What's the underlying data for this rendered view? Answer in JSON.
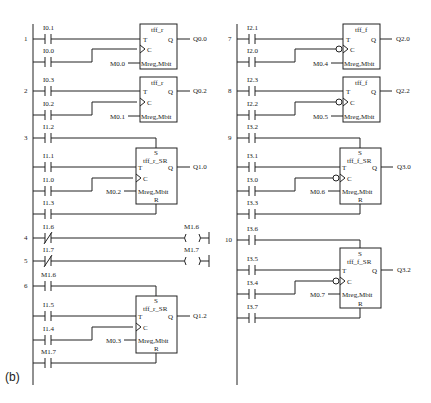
{
  "caption": "(b)",
  "left_column": {
    "networks": [
      {
        "number": "1",
        "type": "tff_r",
        "block_title": "tff_r",
        "T_input": "I0.1",
        "C_input": "I0.0",
        "mem": "M0.0",
        "mem_pin": "Mreg,Mbit",
        "output": "Q0.0",
        "T_pin": "T",
        "C_pin": "C",
        "Q_pin": "Q"
      },
      {
        "number": "2",
        "type": "tff_r",
        "block_title": "tff_r",
        "T_input": "I0.3",
        "C_input": "I0.2",
        "mem": "M0.1",
        "mem_pin": "Mreg,Mbit",
        "output": "Q0.2",
        "T_pin": "T",
        "C_pin": "C",
        "Q_pin": "Q"
      },
      {
        "number": "3",
        "type": "tff_r_SR",
        "block_title": "tff_r_SR",
        "S_input": "I1.2",
        "T_input": "I1.1",
        "C_input": "I1.0",
        "R_input": "I1.3",
        "mem": "M0.2",
        "mem_pin": "Mreg,Mbit",
        "output": "Q1.0",
        "S_pin": "S",
        "R_pin": "R",
        "T_pin": "T",
        "C_pin": "C",
        "Q_pin": "Q"
      },
      {
        "number": "4",
        "type": "coil",
        "contact": "I1.6",
        "contact_type": "normally-closed",
        "coil": "M1.6"
      },
      {
        "number": "5",
        "type": "coil",
        "contact": "I1.7",
        "contact_type": "normally-closed",
        "coil": "M1.7"
      },
      {
        "number": "6",
        "type": "tff_r_SR",
        "block_title": "tff_r_SR",
        "S_input": "M1.6",
        "T_input": "I1.5",
        "C_input": "I1.4",
        "R_input": "M1.7",
        "mem": "M0.3",
        "mem_pin": "Mreg,Mbit",
        "output": "Q1.2",
        "S_pin": "S",
        "R_pin": "R",
        "T_pin": "T",
        "C_pin": "C",
        "Q_pin": "Q"
      }
    ]
  },
  "right_column": {
    "networks": [
      {
        "number": "7",
        "type": "tff_f",
        "block_title": "tff_f",
        "T_input": "I2.1",
        "C_input": "I2.0",
        "mem": "M0.4",
        "mem_pin": "Mreg,Mbit",
        "output": "Q2.0",
        "T_pin": "T",
        "C_pin": "C",
        "Q_pin": "Q"
      },
      {
        "number": "8",
        "type": "tff_f",
        "block_title": "tff_f",
        "T_input": "I2.3",
        "C_input": "I2.2",
        "mem": "M0.5",
        "mem_pin": "Mreg,Mbit",
        "output": "Q2.2",
        "T_pin": "T",
        "C_pin": "C",
        "Q_pin": "Q"
      },
      {
        "number": "9",
        "type": "tff_f_SR",
        "block_title": "tff_f_SR",
        "S_input": "I3.2",
        "T_input": "I3.1",
        "C_input": "I3.0",
        "R_input": "I3.3",
        "mem": "M0.6",
        "mem_pin": "Mreg,Mbit",
        "output": "Q3.0",
        "S_pin": "S",
        "R_pin": "R",
        "T_pin": "T",
        "C_pin": "C",
        "Q_pin": "Q"
      },
      {
        "number": "10",
        "type": "tff_f_SR",
        "block_title": "tff_f_SR",
        "S_input": "I3.6",
        "T_input": "I3.5",
        "C_input": "I3.4",
        "R_input": "I3.7",
        "mem": "M0.7",
        "mem_pin": "Mreg,Mbit",
        "output": "Q3.2",
        "S_pin": "S",
        "R_pin": "R",
        "T_pin": "T",
        "C_pin": "C",
        "Q_pin": "Q"
      }
    ]
  }
}
